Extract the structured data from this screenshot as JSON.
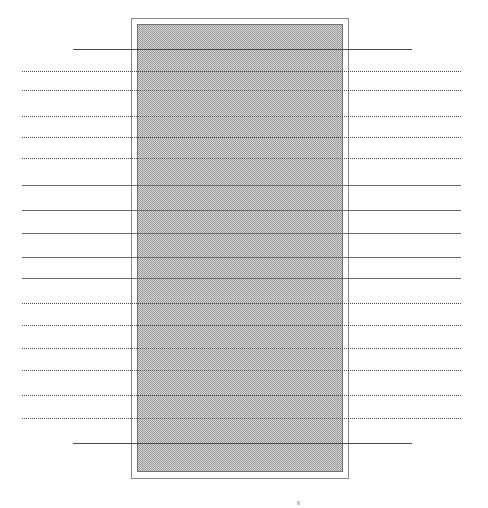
{
  "figure": {
    "canvas": {
      "width": 488,
      "height": 508,
      "background": "#ffffff"
    },
    "panel": {
      "label": "hatched-rectangle",
      "outer": {
        "x": 131,
        "y": 18,
        "width": 218,
        "height": 461
      },
      "inner": {
        "x": 137,
        "y": 24,
        "width": 206,
        "height": 448
      },
      "fill_pattern": "halftone-checker",
      "fill_color": "#d4d4d4",
      "pattern_color": "#9a9a9a",
      "border_color": "#8a8a8a"
    },
    "line_colors": {
      "solid": "#6b6b6b",
      "solid_dark": "#4a4a4a",
      "dotted": "#4a4a4a"
    },
    "speck": {
      "x": 297,
      "y": 501
    }
  },
  "chart_data": {
    "type": "line",
    "subtitle": "",
    "xlabel": "",
    "ylabel": "",
    "grid": false,
    "legend": "none",
    "xlim": [
      0,
      488
    ],
    "ylim": [
      0,
      508
    ],
    "annotations": [],
    "series": [
      {
        "name": "horizontal-rules",
        "orientation": "horizontal",
        "values": [
          {
            "y": 49,
            "x0": 73,
            "x1": 412,
            "style": "solid-dark"
          },
          {
            "y": 71,
            "x0": 22,
            "x1": 461,
            "style": "dotted"
          },
          {
            "y": 90,
            "x0": 22,
            "x1": 461,
            "style": "dotted"
          },
          {
            "y": 116,
            "x0": 22,
            "x1": 461,
            "style": "dotted"
          },
          {
            "y": 137,
            "x0": 22,
            "x1": 461,
            "style": "dotted"
          },
          {
            "y": 158,
            "x0": 22,
            "x1": 461,
            "style": "dotted"
          },
          {
            "y": 185,
            "x0": 22,
            "x1": 461,
            "style": "solid"
          },
          {
            "y": 210,
            "x0": 22,
            "x1": 461,
            "style": "solid"
          },
          {
            "y": 233,
            "x0": 22,
            "x1": 461,
            "style": "solid"
          },
          {
            "y": 257,
            "x0": 22,
            "x1": 461,
            "style": "solid"
          },
          {
            "y": 278,
            "x0": 22,
            "x1": 461,
            "style": "solid"
          },
          {
            "y": 303,
            "x0": 22,
            "x1": 461,
            "style": "dotted"
          },
          {
            "y": 325,
            "x0": 22,
            "x1": 461,
            "style": "dotted"
          },
          {
            "y": 348,
            "x0": 22,
            "x1": 461,
            "style": "dotted"
          },
          {
            "y": 370,
            "x0": 22,
            "x1": 461,
            "style": "dotted"
          },
          {
            "y": 395,
            "x0": 22,
            "x1": 461,
            "style": "dotted"
          },
          {
            "y": 418,
            "x0": 22,
            "x1": 461,
            "style": "dotted"
          },
          {
            "y": 443,
            "x0": 73,
            "x1": 412,
            "style": "solid-dark"
          }
        ]
      }
    ],
    "shapes": [
      {
        "name": "hatched-rectangle",
        "type": "rect",
        "x": 131,
        "y": 18,
        "width": 218,
        "height": 461,
        "fill": "#d4d4d4",
        "hatch": "halftone-checker",
        "edge": "#8a8a8a"
      }
    ]
  }
}
